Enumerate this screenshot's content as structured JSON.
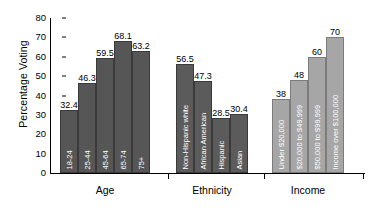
{
  "chart_data": {
    "type": "bar",
    "title": "",
    "xlabel": "",
    "ylabel": "Percentage Voting",
    "ylim": [
      0,
      80
    ],
    "yticks": [
      0,
      10,
      20,
      30,
      40,
      50,
      60,
      70,
      80
    ],
    "grid": false,
    "legend": "none",
    "groups": [
      {
        "name": "Age",
        "categories": [
          "18-24",
          "25-44",
          "45-64",
          "65-74",
          "75+"
        ],
        "values": [
          32.4,
          46.3,
          59.5,
          68.1,
          63.2
        ],
        "color": "#565656"
      },
      {
        "name": "Ethnicity",
        "categories": [
          "Non-Hispanic white",
          "African American",
          "Hispanic",
          "Asian"
        ],
        "values": [
          56.5,
          47.3,
          28.5,
          30.4
        ],
        "color": "#5b5b5b"
      },
      {
        "name": "Income",
        "categories": [
          "Under $20,000",
          "$20,000 to $49,999",
          "$50,000 to $99,999",
          "Income over $100,000"
        ],
        "values": [
          38,
          48,
          60,
          70
        ],
        "color": "#a6a6a6"
      }
    ]
  },
  "axis": {
    "y_title": "Percentage Voting",
    "y_tick_labels": [
      "0",
      "10",
      "20",
      "30",
      "40",
      "50",
      "60",
      "70",
      "80"
    ]
  },
  "group_labels": [
    "Age",
    "Ethnicity",
    "Income"
  ],
  "value_labels": {
    "age": [
      "32.4",
      "46.3",
      "59.5",
      "68.1",
      "63.2"
    ],
    "ethnicity": [
      "56.5",
      "47.3",
      "28.5",
      "30.4"
    ],
    "income": [
      "38",
      "48",
      "60",
      "70"
    ]
  },
  "category_labels": {
    "age": [
      "18-24",
      "25-44",
      "45-64",
      "65-74",
      "75+"
    ],
    "ethnicity": [
      "Non-Hispanic white",
      "African American",
      "Hispanic",
      "Asian"
    ],
    "income": [
      "Under $20,000",
      "$20,000 to $49,999",
      "$50,000 to $99,999",
      "Income over $100,000"
    ]
  },
  "colors": {
    "age_bar": "#565656",
    "ethnicity_bar": "#5b5b5b",
    "income_bar": "#a6a6a6",
    "axis": "#000000",
    "background": "#ffffff"
  }
}
